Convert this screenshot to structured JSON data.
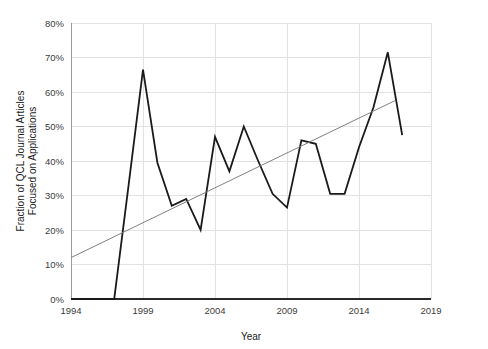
{
  "chart_data": {
    "type": "line",
    "title": "",
    "xlabel": "Year",
    "ylabel": "Fraction of QCL Journal Articles Focused on Applications",
    "ylabel_line1": "Fraction of QCL Journal Articles",
    "ylabel_line2": "Focused on Applications",
    "xlim": [
      1994,
      2019
    ],
    "ylim": [
      0,
      80
    ],
    "xticks": [
      1994,
      1999,
      2004,
      2009,
      2014,
      2019
    ],
    "xticklabels": [
      "1994",
      "1999",
      "2004",
      "2009",
      "2014",
      "2019"
    ],
    "yticks": [
      0,
      10,
      20,
      30,
      40,
      50,
      60,
      70,
      80
    ],
    "yticklabels": [
      "0%",
      "10%",
      "20%",
      "30%",
      "40%",
      "50%",
      "60%",
      "70%",
      "80%"
    ],
    "grid": true,
    "grid_axis": "both",
    "legend": "none",
    "series": [
      {
        "name": "Fraction of QCL Journal Articles Focused on Applications",
        "type": "line",
        "color": "#1a1a1a",
        "width": 1.8,
        "x": [
          1994,
          1995,
          1996,
          1997,
          1998,
          1999,
          2000,
          2001,
          2002,
          2003,
          2004,
          2005,
          2006,
          2007,
          2008,
          2009,
          2010,
          2011,
          2012,
          2013,
          2014,
          2015,
          2016,
          2017
        ],
        "values": [
          0,
          0,
          0,
          0,
          33,
          66.5,
          39.5,
          27,
          29,
          20,
          47,
          37,
          50,
          40,
          30.5,
          26.5,
          46,
          45,
          30.5,
          30.5,
          44,
          55.5,
          71.5,
          47.5
        ]
      },
      {
        "name": "Linear trend",
        "type": "line",
        "color": "#808080",
        "width": 1.0,
        "x": [
          1994,
          2016.5
        ],
        "values": [
          12,
          57.5
        ]
      }
    ]
  }
}
